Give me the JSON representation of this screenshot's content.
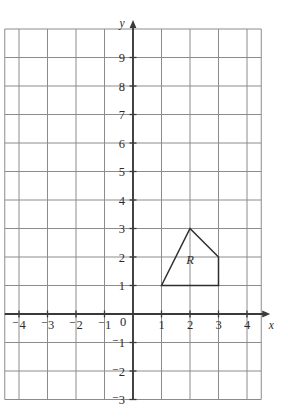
{
  "chart_data": {
    "type": "scatter",
    "title": "",
    "xlabel": "x",
    "ylabel": "y",
    "grid": true,
    "legend": "none",
    "xlim": [
      -4.5,
      4.5
    ],
    "ylim": [
      -3,
      10
    ],
    "x_ticks": [
      -4,
      -3,
      -2,
      -1,
      0,
      1,
      2,
      3,
      4
    ],
    "y_ticks": [
      -3,
      -2,
      -1,
      1,
      2,
      3,
      4,
      5,
      6,
      7,
      8,
      9
    ],
    "x_tick_labels": [
      "⁻4",
      "⁻3",
      "⁻2",
      "⁻1",
      "0",
      "1",
      "2",
      "3",
      "4"
    ],
    "y_tick_labels": [
      "⁻3",
      "⁻2",
      "⁻1",
      "1",
      "2",
      "3",
      "4",
      "5",
      "6",
      "7",
      "8",
      "9"
    ],
    "origin_label": "0",
    "grid_step": 1,
    "annotations": [
      {
        "name": "region-R",
        "label": "R",
        "label_x": 2.0,
        "label_y": 1.9,
        "type": "polygon",
        "vertices": [
          [
            1,
            1
          ],
          [
            2,
            3
          ],
          [
            3,
            2
          ],
          [
            3,
            1
          ]
        ]
      }
    ],
    "colors": {
      "grid": "#8c8c8c",
      "axis": "#3a3a3a",
      "shape_stroke": "#2e2e2e",
      "shape_fill": "none",
      "text": "#2b2b2b",
      "background": "#ffffff"
    }
  },
  "axes": {
    "x_name": "x",
    "y_name": "y"
  }
}
